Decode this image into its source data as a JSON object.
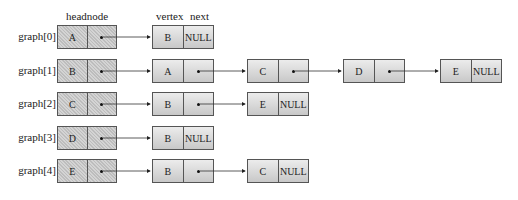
{
  "headers": {
    "headnode": "headnode",
    "vertex": "vertex",
    "next": "next"
  },
  "rows": [
    {
      "label": "graph[0]",
      "head": "A",
      "nodes": [
        {
          "vertex": "B",
          "next": "NULL"
        }
      ]
    },
    {
      "label": "graph[1]",
      "head": "B",
      "nodes": [
        {
          "vertex": "A",
          "next": "•"
        },
        {
          "vertex": "C",
          "next": "•"
        },
        {
          "vertex": "D",
          "next": "•"
        },
        {
          "vertex": "E",
          "next": "NULL"
        }
      ]
    },
    {
      "label": "graph[2]",
      "head": "C",
      "nodes": [
        {
          "vertex": "B",
          "next": "•"
        },
        {
          "vertex": "E",
          "next": "NULL"
        }
      ]
    },
    {
      "label": "graph[3]",
      "head": "D",
      "nodes": [
        {
          "vertex": "B",
          "next": "NULL"
        }
      ]
    },
    {
      "label": "graph[4]",
      "head": "E",
      "nodes": [
        {
          "vertex": "B",
          "next": "•"
        },
        {
          "vertex": "C",
          "next": "NULL"
        }
      ]
    }
  ]
}
